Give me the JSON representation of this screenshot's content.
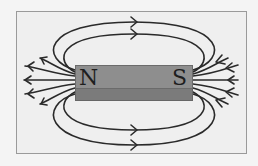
{
  "diagram": {
    "magnet": {
      "north_label": "N",
      "south_label": "S",
      "top_color": "#8e8e8e",
      "front_color": "#7b7b7b"
    },
    "field_line_color": "#2a2a2a",
    "frame_border_color": "#9a9a9a",
    "background_color": "#efefef",
    "arrow_direction": "north-to-south (out of N, into S)"
  }
}
